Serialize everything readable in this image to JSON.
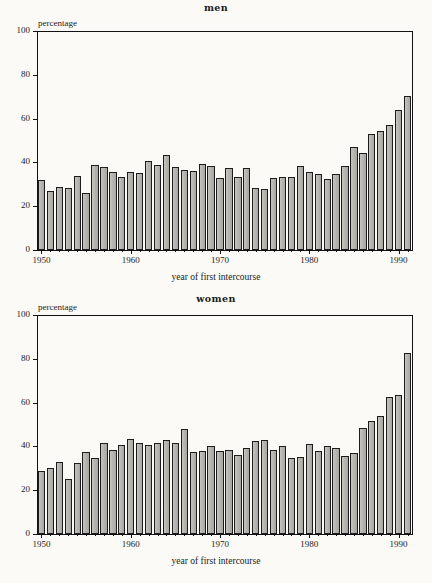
{
  "figure": {
    "background_color": "#fbfaf7",
    "bar_fill_color": "#b9b7b2",
    "bar_edge_color": "#1d1d1d"
  },
  "panels": [
    {
      "id": "men",
      "title": "men"
    },
    {
      "id": "women",
      "title": "women"
    }
  ],
  "axis": {
    "ylabel": "percentage",
    "xlabel": "year of first intercourse",
    "ytick_labels": [
      "0",
      "20",
      "40",
      "60",
      "80",
      "100"
    ],
    "xtick_labels": [
      "1950",
      "1960",
      "1970",
      "1980",
      "1990"
    ]
  },
  "chart_data": [
    {
      "type": "bar",
      "title": "men",
      "xlabel": "year of first intercourse",
      "ylabel": "percentage",
      "ylim": [
        0,
        100
      ],
      "xlim": [
        1949.5,
        1991.5
      ],
      "grid": false,
      "legend": "none",
      "ytick_values": [
        0,
        20,
        40,
        60,
        80,
        100
      ],
      "xtick_values": [
        1950,
        1960,
        1970,
        1980,
        1990
      ],
      "categories": [
        1950,
        1951,
        1952,
        1953,
        1954,
        1955,
        1956,
        1957,
        1958,
        1959,
        1960,
        1961,
        1962,
        1963,
        1964,
        1965,
        1966,
        1967,
        1968,
        1969,
        1970,
        1971,
        1972,
        1973,
        1974,
        1975,
        1976,
        1977,
        1978,
        1979,
        1980,
        1981,
        1982,
        1983,
        1984,
        1985,
        1986,
        1987,
        1988,
        1989,
        1990,
        1991
      ],
      "values": [
        32,
        27,
        29,
        28.5,
        34,
        26,
        39,
        38,
        35.5,
        33.5,
        35.5,
        35,
        40.5,
        39,
        43.5,
        38,
        36.5,
        36,
        39.5,
        38.5,
        33,
        37.5,
        33.5,
        37.5,
        28.5,
        28,
        33,
        33.5,
        33.5,
        38.5,
        35.5,
        34.5,
        32.5,
        34.5,
        38.5,
        47,
        44.5,
        53,
        54.5,
        57,
        64,
        70.5
      ]
    },
    {
      "type": "bar",
      "title": "women",
      "xlabel": "year of first intercourse",
      "ylabel": "percentage",
      "ylim": [
        0,
        100
      ],
      "xlim": [
        1949.5,
        1991.5
      ],
      "grid": false,
      "legend": "none",
      "ytick_values": [
        0,
        20,
        40,
        60,
        80,
        100
      ],
      "xtick_values": [
        1950,
        1960,
        1970,
        1980,
        1990
      ],
      "categories": [
        1950,
        1951,
        1952,
        1953,
        1954,
        1955,
        1956,
        1957,
        1958,
        1959,
        1960,
        1961,
        1962,
        1963,
        1964,
        1965,
        1966,
        1967,
        1968,
        1969,
        1970,
        1971,
        1972,
        1973,
        1974,
        1975,
        1976,
        1977,
        1978,
        1979,
        1980,
        1981,
        1982,
        1983,
        1984,
        1985,
        1986,
        1987,
        1988,
        1989,
        1990,
        1991
      ],
      "values": [
        29,
        30,
        33,
        25,
        32.5,
        37.5,
        34.5,
        41.5,
        38.5,
        40.5,
        43.5,
        41.5,
        40.5,
        41.5,
        43,
        41.5,
        48,
        37.5,
        38,
        40,
        38,
        38.5,
        36,
        39.5,
        42.5,
        43,
        38.5,
        40,
        34.5,
        35,
        41,
        38,
        40,
        39.5,
        35.5,
        37,
        48.5,
        51.5,
        54,
        62.5,
        63.5,
        82.5
      ]
    }
  ]
}
